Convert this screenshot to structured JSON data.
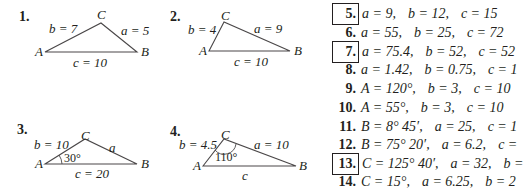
{
  "figures": [
    {
      "number": "1.",
      "vertices": {
        "A": "A",
        "B": "B",
        "C": "C"
      },
      "sides": {
        "a": "a = 5",
        "b": "b = 7",
        "c": "c = 10"
      },
      "angle": ""
    },
    {
      "number": "2.",
      "vertices": {
        "A": "A",
        "B": "B",
        "C": "C"
      },
      "sides": {
        "a": "a = 9",
        "b": "b = 4",
        "c": "c = 10"
      },
      "angle": ""
    },
    {
      "number": "3.",
      "vertices": {
        "A": "A",
        "B": "B",
        "C": "C"
      },
      "sides": {
        "a": "a",
        "b": "b = 10",
        "c": "c = 20"
      },
      "angle": "30°"
    },
    {
      "number": "4.",
      "vertices": {
        "A": "A",
        "B": "B",
        "C": "C"
      },
      "sides": {
        "a": "a = 10",
        "b": "b = 4.5",
        "c": "c"
      },
      "angle": "110°"
    }
  ],
  "problems": [
    {
      "number": "5.",
      "boxed": true,
      "parts": [
        "a = 9,",
        "b = 12,",
        "c = 15"
      ]
    },
    {
      "number": "6.",
      "boxed": false,
      "parts": [
        "a = 55,",
        "b = 25,",
        "c = 72"
      ]
    },
    {
      "number": "7.",
      "boxed": true,
      "parts": [
        "a = 75.4,",
        "b = 52,",
        "c = 52"
      ]
    },
    {
      "number": "8.",
      "boxed": false,
      "parts": [
        "a = 1.42,",
        "b = 0.75,",
        "c = 1"
      ]
    },
    {
      "number": "9.",
      "boxed": false,
      "parts": [
        "A = 120°,",
        "b = 3,",
        "c = 10"
      ]
    },
    {
      "number": "10.",
      "boxed": false,
      "parts": [
        "A = 55°,",
        "b = 3,",
        "c = 10"
      ]
    },
    {
      "number": "11.",
      "boxed": false,
      "parts": [
        "B = 8° 45′,",
        "a = 25,",
        "c = 1"
      ]
    },
    {
      "number": "12.",
      "boxed": false,
      "parts": [
        "B = 75° 20′,",
        "a = 6.2,",
        "c ="
      ]
    },
    {
      "number": "13.",
      "boxed": true,
      "parts": [
        "C = 125° 40′,",
        "a = 32,",
        "b ="
      ]
    },
    {
      "number": "14.",
      "boxed": false,
      "parts": [
        "C = 15°,",
        "a = 6.25,",
        "b = 2"
      ]
    }
  ]
}
